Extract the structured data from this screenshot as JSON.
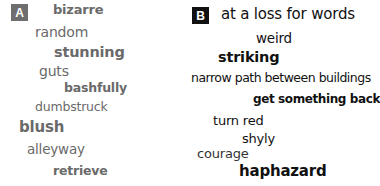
{
  "panel_a": {
    "label": "A",
    "words": [
      {
        "text": "bizarre",
        "bold": true
      },
      {
        "text": "random",
        "bold": false
      },
      {
        "text": "stunning",
        "bold": true
      },
      {
        "text": "guts",
        "bold": false
      },
      {
        "text": "bashfully",
        "bold": true
      },
      {
        "text": "dumbstruck",
        "bold": false
      },
      {
        "text": "blush",
        "bold": true
      },
      {
        "text": "alleyway",
        "bold": false
      },
      {
        "text": "retrieve",
        "bold": true
      }
    ]
  },
  "panel_b": {
    "label": "B",
    "words": [
      {
        "text": "at a loss for words",
        "bold": false
      },
      {
        "text": "weird",
        "bold": false
      },
      {
        "text": "striking",
        "bold": true
      },
      {
        "text": "narrow path between buildings",
        "bold": false
      },
      {
        "text": "get something back",
        "bold": true
      },
      {
        "text": "turn red",
        "bold": false
      },
      {
        "text": "shyly",
        "bold": false
      },
      {
        "text": "courage",
        "bold": false
      },
      {
        "text": "haphazard",
        "bold": true
      }
    ]
  },
  "colors": {
    "panel_a_text": "#6a6a6a",
    "panel_a_badge": "#6e6e6e",
    "panel_b_text": "#111111",
    "panel_b_badge": "#111111"
  }
}
